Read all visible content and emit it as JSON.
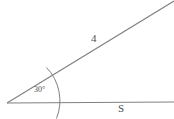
{
  "figure": {
    "labels": {
      "hypotenuse_label": "4",
      "base_label": "S",
      "angle_label": "30°"
    },
    "colors": {
      "stroke": "#808080",
      "text": "#4d4d4d",
      "background": "#ffffff"
    },
    "geometry": {
      "vertex": [
        7,
        103
      ],
      "base_ray_end": [
        174,
        102
      ],
      "diagonal_ray_end": [
        174,
        1
      ],
      "angle_degrees": 30,
      "arc_radius": 48,
      "arc_start": [
        46,
        67
      ],
      "arc_end": [
        56,
        118
      ]
    }
  }
}
